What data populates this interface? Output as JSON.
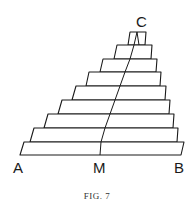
{
  "figure": {
    "caption": "FIG. 7",
    "labels": {
      "apex": "C",
      "base_left": "A",
      "base_mid": "M",
      "base_right": "B"
    },
    "layer_count": 9,
    "colors": {
      "ink": "#1a1a1a",
      "paper": "#ffffff"
    }
  }
}
